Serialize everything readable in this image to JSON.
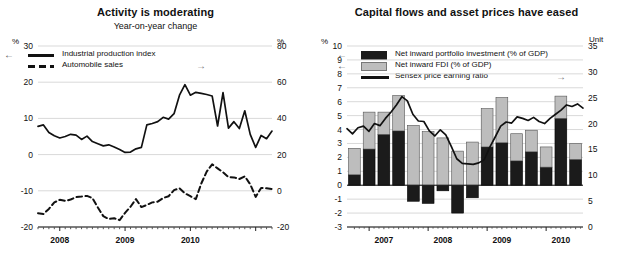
{
  "chart_data": [
    {
      "type": "line",
      "id": "activity",
      "title": "Activity is moderating",
      "subtitle": "Year-on-year change",
      "xlabel": "",
      "ylabel": "%",
      "y2label": "%",
      "ylim": [
        -20,
        30
      ],
      "y2lim": [
        -20,
        80
      ],
      "yticks": [
        30,
        20,
        10,
        0,
        -10,
        -20
      ],
      "y2ticks": [
        80,
        60,
        40,
        20,
        0,
        -20
      ],
      "grid": true,
      "legend_position": "top-left",
      "xticklabels": [
        "2008",
        "2009",
        "2010"
      ],
      "x_start": "2007-09",
      "x_end": "2010-11",
      "series": [
        {
          "name": "Industrial production index",
          "axis": "left",
          "style": "solid",
          "arrow": "left",
          "values": [
            7.8,
            8.2,
            6.1,
            5.2,
            4.6,
            5.0,
            5.6,
            5.4,
            4.2,
            5.1,
            3.6,
            3.0,
            2.4,
            2.7,
            2.1,
            1.4,
            0.6,
            0.7,
            1.6,
            2.0,
            8.2,
            8.6,
            9.1,
            10.3,
            9.8,
            11.3,
            16.4,
            19.3,
            16.4,
            17.2,
            16.9,
            16.6,
            16.2,
            7.9,
            17.1,
            7.3,
            9.1,
            7.2,
            12.1,
            5.6,
            2.0,
            5.3,
            4.4,
            6.5
          ]
        },
        {
          "name": "Automobile sales",
          "axis": "right",
          "style": "dashed",
          "arrow": "right",
          "values": [
            -12.4,
            -12.8,
            -10.0,
            -6.4,
            -5.0,
            -5.6,
            -4.8,
            -3.5,
            -3.2,
            -2.8,
            -4.0,
            -9.2,
            -14.0,
            -15.6,
            -15.2,
            -16.2,
            -12.2,
            -8.8,
            -4.6,
            -9.0,
            -7.8,
            -6.4,
            -6.0,
            -4.0,
            -3.0,
            0.4,
            1.4,
            -1.4,
            -3.0,
            -4.6,
            4.0,
            10.6,
            14.6,
            12.4,
            10.2,
            7.6,
            7.4,
            6.5,
            8.0,
            3.6,
            -3.4,
            1.6,
            1.4,
            1.0
          ]
        }
      ]
    },
    {
      "type": "bar",
      "id": "capital-flows",
      "title": "Capital flows and asset prices have eased",
      "subtitle": "",
      "xlabel": "",
      "ylabel": "%",
      "y2label": "Unit",
      "ylim": [
        -3,
        10
      ],
      "y2lim": [
        0,
        35
      ],
      "yticks": [
        10,
        9,
        8,
        7,
        6,
        5,
        4,
        3,
        2,
        1,
        0,
        -1,
        -2,
        -3
      ],
      "y2ticks": [
        35,
        30,
        25,
        20,
        15,
        10,
        5,
        0
      ],
      "grid": true,
      "stacked": true,
      "legend_position": "top-left",
      "xticklabels": [
        "2007",
        "2008",
        "2009",
        "2010"
      ],
      "categories": [
        "2006Q4",
        "2007Q1",
        "2007Q2",
        "2007Q3",
        "2007Q4",
        "2008Q1",
        "2008Q2",
        "2008Q3",
        "2008Q4",
        "2009Q1",
        "2009Q2",
        "2009Q3",
        "2009Q4",
        "2010Q1",
        "2010Q2",
        "2010Q3"
      ],
      "series": [
        {
          "name": "Net inward portfolio investment (% of GDP)",
          "axis": "left",
          "color": "#1b1b1b",
          "arrow": "left",
          "values": [
            0.75,
            2.6,
            3.65,
            3.9,
            -1.15,
            -1.3,
            -0.4,
            -2.0,
            -0.9,
            2.75,
            3.05,
            1.75,
            2.4,
            1.3,
            4.8,
            1.85
          ]
        },
        {
          "name": "Net inward FDI (% of GDP)",
          "axis": "left",
          "color": "#bdbdbd",
          "arrow": "left",
          "values": [
            1.9,
            2.65,
            1.6,
            2.55,
            4.3,
            3.85,
            3.4,
            2.45,
            3.1,
            2.75,
            3.25,
            1.95,
            1.55,
            1.45,
            1.6,
            1.15
          ]
        },
        {
          "name": "Sensex price earning ratio",
          "axis": "right",
          "style": "solid",
          "arrow": "right",
          "values": [
            19.0,
            18.0,
            19.2,
            19.5,
            18.5,
            20.0,
            19.6,
            21.0,
            22.2,
            23.6,
            25.2,
            24.4,
            21.8,
            20.5,
            20.4,
            18.6,
            17.6,
            18.8,
            17.8,
            15.6,
            13.2,
            12.3,
            12.2,
            12.1,
            12.4,
            13.0,
            15.4,
            17.4,
            19.5,
            20.3,
            20.1,
            21.3,
            21.0,
            20.6,
            21.2,
            20.4,
            20.0,
            21.0,
            21.8,
            22.6,
            23.6,
            23.3,
            23.8,
            23.0
          ]
        }
      ]
    }
  ],
  "panels": {
    "left": {
      "title": "Activity is moderating",
      "subtitle": "Year-on-year change",
      "unit_left": "%",
      "unit_right": "%",
      "yticks": [
        "30",
        "20",
        "10",
        "0",
        "-10",
        "-20"
      ],
      "y2ticks": [
        "80",
        "60",
        "40",
        "20",
        "0",
        "-20"
      ],
      "xticks": [
        "2008",
        "2009",
        "2010"
      ],
      "legend": [
        {
          "label": "Industrial production index",
          "marker": "solid-line",
          "arrow": "left"
        },
        {
          "label": "Automobile sales",
          "marker": "dashed-line",
          "arrow": "right"
        }
      ]
    },
    "right": {
      "title": "Capital flows and asset prices have eased",
      "subtitle": "",
      "unit_left": "%",
      "unit_right": "Unit",
      "yticks": [
        "10",
        "9",
        "8",
        "7",
        "6",
        "5",
        "4",
        "3",
        "2",
        "1",
        "0",
        "-1",
        "-2",
        "-3"
      ],
      "y2ticks": [
        "35",
        "30",
        "25",
        "20",
        "15",
        "10",
        "5",
        "0"
      ],
      "xticks": [
        "2007",
        "2008",
        "2009",
        "2010"
      ],
      "legend": [
        {
          "label": "Net inward portfolio investment (% of GDP)",
          "marker": "dark-swatch",
          "arrow": "left"
        },
        {
          "label": "Net inward FDI (% of GDP)",
          "marker": "light-swatch",
          "arrow": "left"
        },
        {
          "label": "Sensex price earning ratio",
          "marker": "solid-line",
          "arrow": "right"
        }
      ]
    }
  },
  "colors": {
    "portfolio": "#1b1b1b",
    "fdi": "#bdbdbd",
    "line": "#111111",
    "grid": "#d9d9d9"
  }
}
